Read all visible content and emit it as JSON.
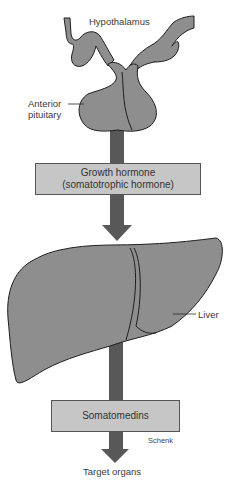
{
  "colors": {
    "organ_fill": "#8e8e8e",
    "arrow_fill": "#585858",
    "box_fill": "#c6c6c6",
    "outline": "#1e1e1e"
  },
  "labels": {
    "hypothalamus": "Hypothalamus",
    "anterior_pituitary_line1": "Anterior",
    "anterior_pituitary_line2": "pituitary",
    "liver": "Liver",
    "target_organs": "Target organs",
    "credit": "Schenk"
  },
  "boxes": {
    "growth_hormone": {
      "line1": "Growth hormone",
      "line2": "(somatotrophic hormone)"
    },
    "somatomedins": {
      "line1": "Somatomedins"
    }
  },
  "flow": [
    "Hypothalamus",
    "Anterior pituitary",
    "Growth hormone (somatotrophic hormone)",
    "Liver",
    "Somatomedins",
    "Target organs"
  ]
}
